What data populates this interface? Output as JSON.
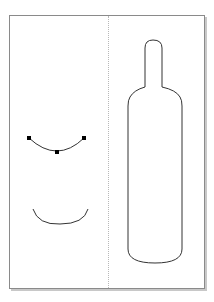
{
  "canvas": {
    "page": {
      "x": 9,
      "y": 15,
      "width": 194,
      "height": 272,
      "border_color": "#8a8a8a",
      "shadow_color": "#c8c8c8"
    },
    "guideline": {
      "orientation": "vertical",
      "x": 108,
      "color": "#b8b8b8",
      "style": "dotted"
    },
    "objects": [
      {
        "name": "selected-arc",
        "type": "curve",
        "selected": true,
        "stroke": "#333333",
        "nodes": [
          {
            "x": 29,
            "y": 138
          },
          {
            "x": 57,
            "y": 152
          },
          {
            "x": 84,
            "y": 138
          }
        ]
      },
      {
        "name": "arc",
        "type": "curve",
        "selected": false,
        "stroke": "#333333"
      },
      {
        "name": "bottle-outline",
        "type": "path",
        "selected": false,
        "stroke": "#333333"
      }
    ]
  }
}
